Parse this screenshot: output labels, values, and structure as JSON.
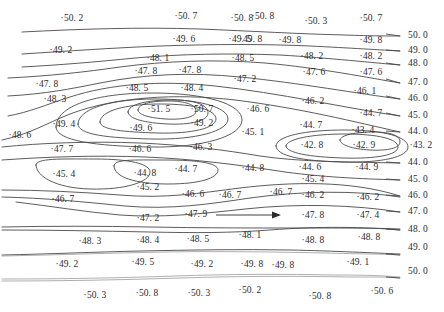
{
  "chart_data": {
    "type": "contour",
    "title": "",
    "subtitle": "",
    "xlabel": "",
    "ylabel": "",
    "grid": false,
    "legend_position": "right-edge-inline",
    "contour_interval": 1.0,
    "contour_levels": [
      44.0,
      45.0,
      46.0,
      47.0,
      48.0,
      49.0,
      50.0
    ],
    "level_labels_right": [
      {
        "text": "50. 0",
        "x": 408,
        "y": 36
      },
      {
        "text": "49. 0",
        "x": 408,
        "y": 51
      },
      {
        "text": "48. 0",
        "x": 408,
        "y": 64
      },
      {
        "text": "47. 0",
        "x": 408,
        "y": 83
      },
      {
        "text": "46. 0",
        "x": 408,
        "y": 99
      },
      {
        "text": "45. 0",
        "x": 408,
        "y": 116
      },
      {
        "text": "44. 0",
        "x": 408,
        "y": 132
      },
      {
        "text": "44. 0",
        "x": 408,
        "y": 163
      },
      {
        "text": "45. 0",
        "x": 408,
        "y": 180
      },
      {
        "text": "46. 0",
        "x": 408,
        "y": 196
      },
      {
        "text": "47. 0",
        "x": 408,
        "y": 212
      },
      {
        "text": "48. 0",
        "x": 408,
        "y": 230
      },
      {
        "text": "49. 0",
        "x": 408,
        "y": 248
      },
      {
        "text": "50. 0",
        "x": 408,
        "y": 272
      }
    ],
    "data_points": [
      {
        "label": "50. 2",
        "value": 50.2,
        "x": 72,
        "y": 19
      },
      {
        "label": "50. 7",
        "value": 50.7,
        "x": 186,
        "y": 17
      },
      {
        "label": "50. 8",
        "value": 50.8,
        "x": 263,
        "y": 17
      },
      {
        "label": "50. 8",
        "value": 50.8,
        "x": 242,
        "y": 19
      },
      {
        "label": "50. 3",
        "value": 50.3,
        "x": 316,
        "y": 22
      },
      {
        "label": "50. 7",
        "value": 50.7,
        "x": 371,
        "y": 19
      },
      {
        "label": "49. 2",
        "value": 49.2,
        "x": 61,
        "y": 51
      },
      {
        "label": "49. 6",
        "value": 49.6,
        "x": 184,
        "y": 40
      },
      {
        "label": "49. 5",
        "value": 49.5,
        "x": 240,
        "y": 40
      },
      {
        "label": "49. 8",
        "value": 49.8,
        "x": 251,
        "y": 40
      },
      {
        "label": "49. 8",
        "value": 49.8,
        "x": 290,
        "y": 41
      },
      {
        "label": "49. 8",
        "value": 49.8,
        "x": 371,
        "y": 41
      },
      {
        "label": "48. 1",
        "value": 48.1,
        "x": 158,
        "y": 59
      },
      {
        "label": "48. 5",
        "value": 48.5,
        "x": 243,
        "y": 59
      },
      {
        "label": "48. 2",
        "value": 48.2,
        "x": 312,
        "y": 57
      },
      {
        "label": "48. 2",
        "value": 48.2,
        "x": 371,
        "y": 57
      },
      {
        "label": "47. 8",
        "value": 47.8,
        "x": 146,
        "y": 72
      },
      {
        "label": "47. 8",
        "value": 47.8,
        "x": 190,
        "y": 71
      },
      {
        "label": "47. 8",
        "value": 47.8,
        "x": 47,
        "y": 85
      },
      {
        "label": "47. 2",
        "value": 47.2,
        "x": 245,
        "y": 80
      },
      {
        "label": "47. 6",
        "value": 47.6,
        "x": 314,
        "y": 73
      },
      {
        "label": "47. 6",
        "value": 47.6,
        "x": 371,
        "y": 73
      },
      {
        "label": "48. 5",
        "value": 48.5,
        "x": 137,
        "y": 89
      },
      {
        "label": "48. 4",
        "value": 48.4,
        "x": 192,
        "y": 89
      },
      {
        "label": "46. 1",
        "value": 46.1,
        "x": 365,
        "y": 92
      },
      {
        "label": "48. 3",
        "value": 48.3,
        "x": 55,
        "y": 100
      },
      {
        "label": "46. 6",
        "value": 46.6,
        "x": 258,
        "y": 110
      },
      {
        "label": "46. 2",
        "value": 46.2,
        "x": 313,
        "y": 102
      },
      {
        "label": "51. 5",
        "value": 51.5,
        "x": 159,
        "y": 110
      },
      {
        "label": "50. 7",
        "value": 50.7,
        "x": 202,
        "y": 110
      },
      {
        "label": "44. 7",
        "value": 44.7,
        "x": 371,
        "y": 114
      },
      {
        "label": "49. 4",
        "value": 49.4,
        "x": 64,
        "y": 125
      },
      {
        "label": "49. 6",
        "value": 49.6,
        "x": 141,
        "y": 129
      },
      {
        "label": "49. 2",
        "value": 49.2,
        "x": 202,
        "y": 124
      },
      {
        "label": "45. 1",
        "value": 45.1,
        "x": 253,
        "y": 133
      },
      {
        "label": "44. 7",
        "value": 44.7,
        "x": 311,
        "y": 126
      },
      {
        "label": "43. 4",
        "value": 43.4,
        "x": 363,
        "y": 131
      },
      {
        "label": "48. 6",
        "value": 48.6,
        "x": 20,
        "y": 136
      },
      {
        "label": "43. 2",
        "value": 43.2,
        "x": 421,
        "y": 146
      },
      {
        "label": "47. 7",
        "value": 47.7,
        "x": 62,
        "y": 150
      },
      {
        "label": "46. 6",
        "value": 46.6,
        "x": 140,
        "y": 150
      },
      {
        "label": "46. 3",
        "value": 46.3,
        "x": 201,
        "y": 148
      },
      {
        "label": "42. 8",
        "value": 42.8,
        "x": 312,
        "y": 146
      },
      {
        "label": "42. 9",
        "value": 42.9,
        "x": 364,
        "y": 146
      },
      {
        "label": "45. 4",
        "value": 45.4,
        "x": 64,
        "y": 175
      },
      {
        "label": "44. 8",
        "value": 44.8,
        "x": 145,
        "y": 174
      },
      {
        "label": "44. 7",
        "value": 44.7,
        "x": 186,
        "y": 170
      },
      {
        "label": "44. 8",
        "value": 44.8,
        "x": 253,
        "y": 169
      },
      {
        "label": "44. 6",
        "value": 44.6,
        "x": 310,
        "y": 168
      },
      {
        "label": "44. 9",
        "value": 44.9,
        "x": 367,
        "y": 168
      },
      {
        "label": "45. 2",
        "value": 45.2,
        "x": 148,
        "y": 188
      },
      {
        "label": "45. 4",
        "value": 45.4,
        "x": 313,
        "y": 180
      },
      {
        "label": "46. 6",
        "value": 46.6,
        "x": 193,
        "y": 195
      },
      {
        "label": "46. 7",
        "value": 46.7,
        "x": 63,
        "y": 200
      },
      {
        "label": "46. 7",
        "value": 46.7,
        "x": 281,
        "y": 193
      },
      {
        "label": "46. 2",
        "value": 46.2,
        "x": 313,
        "y": 196
      },
      {
        "label": "46. 2",
        "value": 46.2,
        "x": 368,
        "y": 198
      },
      {
        "label": "46. 7",
        "value": 46.7,
        "x": 230,
        "y": 196
      },
      {
        "label": "47. 2",
        "value": 47.2,
        "x": 148,
        "y": 219
      },
      {
        "label": "47. 9",
        "value": 47.9,
        "x": 196,
        "y": 215
      },
      {
        "label": "47. 8",
        "value": 47.8,
        "x": 313,
        "y": 216
      },
      {
        "label": "47. 4",
        "value": 47.4,
        "x": 368,
        "y": 216
      },
      {
        "label": "48. 3",
        "value": 48.3,
        "x": 90,
        "y": 242
      },
      {
        "label": "48. 4",
        "value": 48.4,
        "x": 148,
        "y": 241
      },
      {
        "label": "48. 5",
        "value": 48.5,
        "x": 198,
        "y": 240
      },
      {
        "label": "48. 1",
        "value": 48.1,
        "x": 250,
        "y": 236
      },
      {
        "label": "48. 8",
        "value": 48.8,
        "x": 313,
        "y": 241
      },
      {
        "label": "48. 8",
        "value": 48.8,
        "x": 369,
        "y": 238
      },
      {
        "label": "49. 2",
        "value": 49.2,
        "x": 67,
        "y": 265
      },
      {
        "label": "49. 5",
        "value": 49.5,
        "x": 143,
        "y": 263
      },
      {
        "label": "49. 2",
        "value": 49.2,
        "x": 202,
        "y": 265
      },
      {
        "label": "49. 8",
        "value": 49.8,
        "x": 252,
        "y": 265
      },
      {
        "label": "49. 8",
        "value": 49.8,
        "x": 283,
        "y": 266
      },
      {
        "label": "49. 1",
        "value": 49.1,
        "x": 358,
        "y": 263
      },
      {
        "label": "50. 3",
        "value": 50.3,
        "x": 95,
        "y": 296
      },
      {
        "label": "50. 8",
        "value": 50.8,
        "x": 147,
        "y": 294
      },
      {
        "label": "50. 3",
        "value": 50.3,
        "x": 199,
        "y": 294
      },
      {
        "label": "50. 2",
        "value": 50.2,
        "x": 250,
        "y": 291
      },
      {
        "label": "50. 8",
        "value": 50.8,
        "x": 320,
        "y": 297
      },
      {
        "label": "50. 6",
        "value": 50.6,
        "x": 382,
        "y": 292
      }
    ],
    "annotations": [
      {
        "name": "flow-direction-arrow",
        "type": "arrow",
        "x1": 216,
        "y1": 215,
        "x2": 281,
        "y2": 215
      }
    ],
    "closed_maxima": [
      {
        "center_label": "51. 5",
        "value": 51.5,
        "x": 159,
        "y": 110
      },
      {
        "center_label": "50. 7",
        "value": 50.7,
        "x": 202,
        "y": 110
      }
    ],
    "closed_minima": [
      {
        "center_label": "42. 8",
        "value": 42.8,
        "x": 312,
        "y": 146
      },
      {
        "center_label": "42. 9",
        "value": 42.9,
        "x": 364,
        "y": 146
      }
    ],
    "colors": {
      "background": "#ffffff",
      "contour_line": "#4a4a4a",
      "contour_line_faint": "#9a9a9a",
      "text": "#2b2b2b"
    }
  }
}
